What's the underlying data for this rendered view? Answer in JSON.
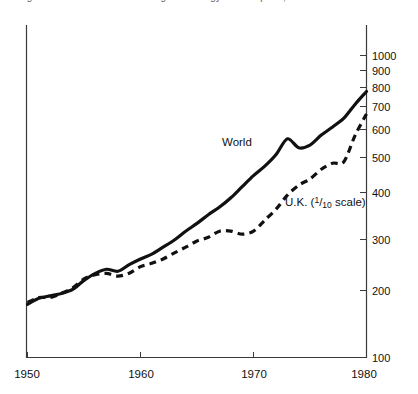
{
  "page": {
    "cut_off_caption_fragment": "Figure 3.  World and United Kingdom energy consumption, 1950-1980",
    "background_color": "#ffffff",
    "ink_color": "#111111"
  },
  "chart_data": {
    "type": "line",
    "title": "",
    "subtitle": "",
    "xlabel": "",
    "ylabel": "",
    "scale": "log",
    "xlim": [
      1950,
      1980
    ],
    "ylim": [
      100,
      1100
    ],
    "grid": false,
    "legend_position": "inline-annotations",
    "x_tick_labels": [
      "1950",
      "1960",
      "1970",
      "1980"
    ],
    "x_ticks": [
      1950,
      1960,
      1970,
      1980
    ],
    "y_tick_labels": [
      "100",
      "200",
      "300",
      "400",
      "500",
      "600",
      "700",
      "800",
      "900",
      "1000"
    ],
    "y_ticks": [
      100,
      200,
      300,
      400,
      500,
      600,
      700,
      800,
      900,
      1000
    ],
    "y_axis_side": "right",
    "annotations": [
      {
        "name": "world-series-label",
        "text": "World",
        "x": 1968.0,
        "y": 430
      },
      {
        "name": "uk-series-label",
        "text_before": "U.K. (",
        "text_fraction_numerator": "1",
        "text_fraction_denominator": "10",
        "text_after": " scale)",
        "text": "U.K. (1/10 scale)",
        "x": 1971.5,
        "y": 262
      }
    ],
    "series": [
      {
        "name": "World",
        "style": "solid",
        "x": [
          1950,
          1951,
          1952,
          1953,
          1954,
          1955,
          1956,
          1957,
          1958,
          1959,
          1960,
          1961,
          1962,
          1963,
          1964,
          1965,
          1966,
          1967,
          1968,
          1969,
          1970,
          1971,
          1972,
          1973,
          1974,
          1975,
          1976,
          1977,
          1978,
          1979,
          1980
        ],
        "values": [
          150,
          157,
          160,
          163,
          168,
          180,
          190,
          196,
          193,
          203,
          212,
          220,
          232,
          245,
          262,
          278,
          297,
          315,
          338,
          368,
          400,
          430,
          470,
          530,
          495,
          505,
          545,
          580,
          620,
          690,
          760
        ]
      },
      {
        "name": "U.K. (1/10 scale)",
        "style": "dashed",
        "x": [
          1950,
          1951,
          1952,
          1953,
          1954,
          1955,
          1956,
          1957,
          1958,
          1959,
          1960,
          1961,
          1962,
          1963,
          1964,
          1965,
          1966,
          1967,
          1968,
          1969,
          1970,
          1971,
          1972,
          1973,
          1974,
          1975,
          1976,
          1977,
          1978,
          1979,
          1980
        ],
        "values": [
          152,
          158,
          158,
          163,
          170,
          182,
          188,
          190,
          186,
          190,
          200,
          205,
          212,
          222,
          232,
          243,
          250,
          262,
          262,
          256,
          262,
          285,
          310,
          345,
          372,
          390,
          420,
          440,
          445,
          545,
          640
        ]
      }
    ]
  }
}
